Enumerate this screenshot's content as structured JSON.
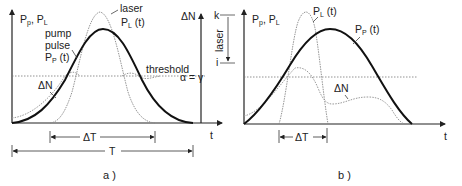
{
  "panel_a": {
    "y_axis_label": {
      "main1": "P",
      "sub1": "p",
      "sep": ", ",
      "main2": "P",
      "sub2": "L"
    },
    "laser_label": {
      "line1": "laser",
      "main": "P",
      "sub": "L",
      "tail": " (t)"
    },
    "pump_label": {
      "line1": "pump",
      "line2": "pulse",
      "main": "P",
      "sub": "P",
      "tail": " (t)"
    },
    "threshold_label": "threshold",
    "alpha_gamma_label": "α = γ",
    "delta_n_label": "ΔN",
    "delta_n_axis_label": "ΔN",
    "k_label": "k",
    "i_label": "i",
    "laser_bracket_label": "laser",
    "t_label": "t",
    "delta_t_label": "ΔT",
    "T_label": "T",
    "caption": "a )"
  },
  "panel_b": {
    "y_axis_label": {
      "main1": "P",
      "sub1": "p",
      "sep": ", ",
      "main2": "P",
      "sub2": "L"
    },
    "laser_label": {
      "main": "P",
      "sub": "L",
      "tail": " (t)"
    },
    "pump_label": {
      "main": "P",
      "sub": "P",
      "tail": " (t)"
    },
    "delta_n_label": "ΔN",
    "t_label": "t",
    "delta_t_label": "ΔT",
    "caption": "b )"
  }
}
